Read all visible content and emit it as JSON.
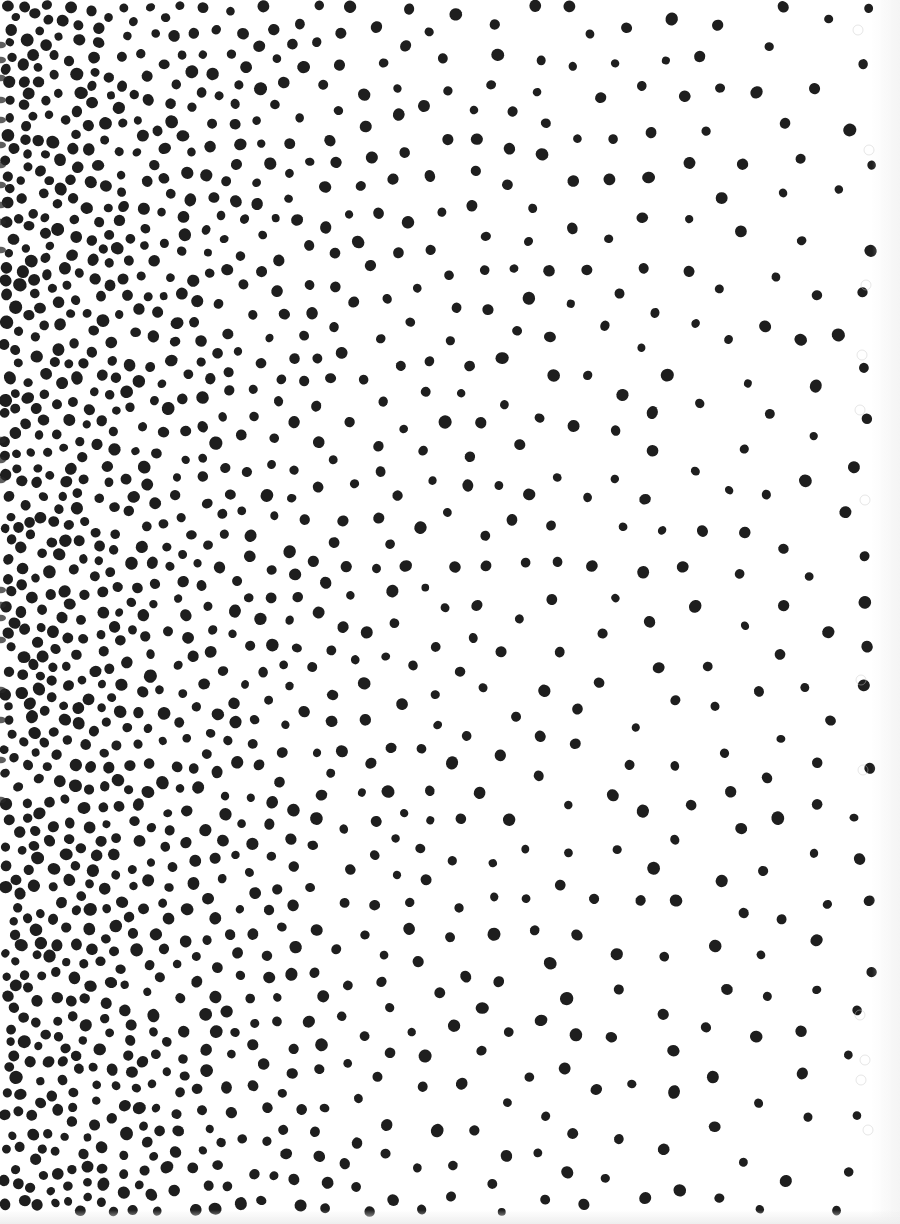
{
  "image": {
    "subject": "stippled dot density gradient",
    "width": 900,
    "height": 1224,
    "background_color": "#ffffff",
    "ink_color": "#1e1e1e",
    "gradient_direction": "dense-left-to-sparse-right"
  },
  "stipple": {
    "seed": 1337,
    "dot_radius_min": 4.2,
    "dot_radius_max": 6.4,
    "density_profile": [
      {
        "x": 0,
        "spacing": 13
      },
      {
        "x": 120,
        "spacing": 16
      },
      {
        "x": 250,
        "spacing": 22
      },
      {
        "x": 400,
        "spacing": 30
      },
      {
        "x": 600,
        "spacing": 38
      },
      {
        "x": 860,
        "spacing": 44
      }
    ],
    "margin_right": 872,
    "margin_bottom": 1212
  },
  "artifacts": {
    "left_edge_bleed_rows": [
      45,
      60,
      78,
      100,
      120,
      145,
      165,
      185,
      205,
      222,
      250,
      440,
      460,
      480,
      590,
      605,
      618,
      640,
      690,
      720,
      760,
      800
    ],
    "ghost_rings": [
      {
        "x": 858,
        "y": 30
      },
      {
        "x": 869,
        "y": 150
      },
      {
        "x": 866,
        "y": 285
      },
      {
        "x": 862,
        "y": 355
      },
      {
        "x": 860,
        "y": 410
      },
      {
        "x": 865,
        "y": 500
      },
      {
        "x": 861,
        "y": 680
      },
      {
        "x": 863,
        "y": 770
      },
      {
        "x": 860,
        "y": 1015
      },
      {
        "x": 865,
        "y": 1060
      },
      {
        "x": 861,
        "y": 1080
      },
      {
        "x": 868,
        "y": 1130
      }
    ]
  }
}
